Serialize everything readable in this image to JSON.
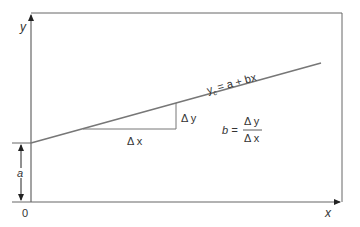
{
  "diagram": {
    "type": "linear-regression-line",
    "axes": {
      "x_label": "x",
      "y_label": "y",
      "origin_label": "0"
    },
    "line": {
      "equation_lhs": "y",
      "equation_sub": "c",
      "equation_rhs": "= a + bx"
    },
    "intercept": {
      "label": "a"
    },
    "triangle": {
      "dx_label": "Δ x",
      "dy_label": "Δ y"
    },
    "slope_formula": {
      "lhs": "b =",
      "numerator": "Δ y",
      "denominator": "Δ x"
    },
    "colors": {
      "frame": "#666666",
      "line": "#777777",
      "text": "#333333",
      "background": "#ffffff"
    }
  }
}
